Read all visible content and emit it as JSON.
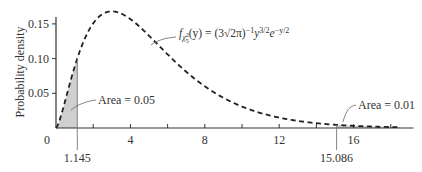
{
  "chart_data": {
    "type": "line",
    "title": "",
    "xlabel": "",
    "ylabel": "Probability density",
    "xlim": [
      0,
      19
    ],
    "ylim": [
      0,
      0.16
    ],
    "x_ticks": [
      0,
      2,
      4,
      6,
      8,
      10,
      12,
      14,
      16,
      18
    ],
    "x_tick_labels": [
      {
        "value": 0,
        "label": "0"
      },
      {
        "value": 4,
        "label": "4"
      },
      {
        "value": 8,
        "label": "8"
      },
      {
        "value": 12,
        "label": "12"
      },
      {
        "value": 16,
        "label": "16"
      }
    ],
    "y_ticks": [
      0.05,
      0.1,
      0.15
    ],
    "y_tick_labels": [
      "0.05",
      "0.10",
      "0.15"
    ],
    "grid": false,
    "series": [
      {
        "name": "chi-square pdf, 5 degrees of freedom",
        "style": "dashed",
        "color": "#222222",
        "degrees_of_freedom": 5,
        "x_range": [
          0,
          18.5
        ]
      }
    ],
    "shaded_regions": [
      {
        "from": 0,
        "to": 1.145,
        "area_label": "Area = 0.05",
        "color": "#c8c8c8"
      },
      {
        "from": 15.086,
        "to": 18.5,
        "area_label": "Area = 0.01",
        "color": "#c8c8c8"
      }
    ],
    "critical_values": [
      {
        "value": 1.145,
        "label": "1.145"
      },
      {
        "value": 15.086,
        "label": "15.086"
      }
    ],
    "annotations": {
      "formula": {
        "f": "f",
        "sub_chi": "χ",
        "sub_sup": "2",
        "sub_sub": "5",
        "arg": "(y) = (3√2π)",
        "exp1": "−1",
        "y": "y",
        "exp2": "3/2",
        "e": "e",
        "exp3": "−y/2"
      },
      "left_area": "Area = 0.05",
      "right_area": "Area = 0.01"
    }
  }
}
